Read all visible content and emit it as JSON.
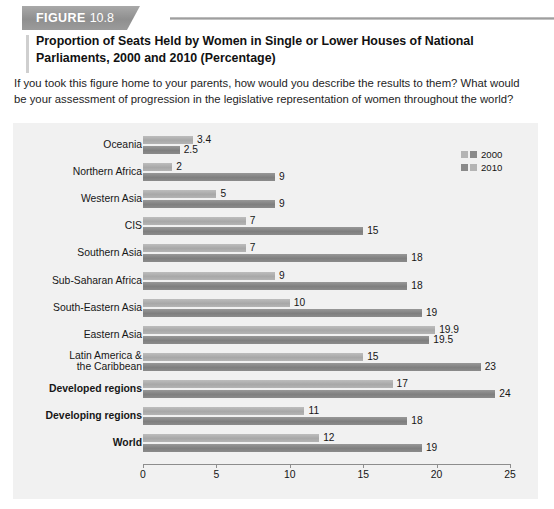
{
  "figure": {
    "badge_word": "FIGURE",
    "badge_number": "10.8",
    "title": "Proportion of Seats Held by Women in Single or Lower Houses of National Parliaments, 2000 and 2010 (Percentage)",
    "prompt": "If you took this figure home to your parents, how would you describe the results to them? What would be your assessment of progression in the legislative representation of women throughout the world?"
  },
  "chart_data": {
    "type": "bar",
    "orientation": "horizontal",
    "title": "Proportion of Seats Held by Women in Single or Lower Houses of National Parliaments, 2000 and 2010 (Percentage)",
    "xlabel": "",
    "ylabel": "",
    "xlim": [
      0,
      25
    ],
    "xticks": [
      "0",
      "5",
      "10",
      "15",
      "20",
      "25"
    ],
    "grid": false,
    "legend_position": "top-right",
    "legend": [
      "2000",
      "2010"
    ],
    "colors": {
      "series_2000": "#b4b4b4",
      "series_2010": "#8a8a8a",
      "panel": "#f1f1f1"
    },
    "categories": [
      "Oceania",
      "Northern Africa",
      "Western Asia",
      "CIS",
      "Southern Asia",
      "Sub-Saharan Africa",
      "South-Eastern Asia",
      "Eastern Asia",
      "Latin America & the Caribbean",
      "Developed regions",
      "Developing regions",
      "World"
    ],
    "series": [
      {
        "name": "2000",
        "values": [
          3.4,
          2,
          5,
          7,
          7,
          9,
          10,
          19.9,
          15,
          17,
          11,
          12
        ],
        "labels": [
          "3.4",
          "2",
          "5",
          "7",
          "7",
          "9",
          "10",
          "19.9",
          "15",
          "17",
          "11",
          "12"
        ]
      },
      {
        "name": "2010",
        "values": [
          2.5,
          9,
          9,
          15,
          18,
          18,
          19,
          19.5,
          23,
          24,
          18,
          19
        ],
        "labels": [
          "2.5",
          "9",
          "9",
          "15",
          "18",
          "18",
          "19",
          "19.5",
          "23",
          "24",
          "18",
          "19"
        ]
      }
    ],
    "rows": [
      {
        "label": "Oceania",
        "bold": false,
        "two_line": false,
        "top": {
          "series": "2000",
          "value": 3.4,
          "label": "3.4"
        },
        "bottom": {
          "series": "2010",
          "value": 2.5,
          "label": "2.5"
        }
      },
      {
        "label": "Northern Africa",
        "bold": false,
        "two_line": false,
        "top": {
          "series": "2000",
          "value": 2,
          "label": "2"
        },
        "bottom": {
          "series": "2010",
          "value": 9,
          "label": "9"
        }
      },
      {
        "label": "Western Asia",
        "bold": false,
        "two_line": false,
        "top": {
          "series": "2000",
          "value": 5,
          "label": "5"
        },
        "bottom": {
          "series": "2010",
          "value": 9,
          "label": "9"
        }
      },
      {
        "label": "CIS",
        "bold": false,
        "two_line": false,
        "top": {
          "series": "2000",
          "value": 7,
          "label": "7"
        },
        "bottom": {
          "series": "2010",
          "value": 15,
          "label": "15"
        }
      },
      {
        "label": "Southern Asia",
        "bold": false,
        "two_line": false,
        "top": {
          "series": "2000",
          "value": 7,
          "label": "7"
        },
        "bottom": {
          "series": "2010",
          "value": 18,
          "label": "18"
        }
      },
      {
        "label": "Sub-Saharan Africa",
        "bold": false,
        "two_line": false,
        "top": {
          "series": "2000",
          "value": 9,
          "label": "9"
        },
        "bottom": {
          "series": "2010",
          "value": 18,
          "label": "18"
        }
      },
      {
        "label": "South-Eastern Asia",
        "bold": false,
        "two_line": false,
        "top": {
          "series": "2000",
          "value": 10,
          "label": "10"
        },
        "bottom": {
          "series": "2010",
          "value": 19,
          "label": "19"
        }
      },
      {
        "label": "Eastern Asia",
        "bold": false,
        "two_line": false,
        "top": {
          "series": "2000",
          "value": 19.9,
          "label": "19.9"
        },
        "bottom": {
          "series": "2010",
          "value": 19.5,
          "label": "19.5"
        }
      },
      {
        "label": "Latin America &\nthe Caribbean",
        "bold": false,
        "two_line": true,
        "label_line1": "Latin America &",
        "label_line2": "the Caribbean",
        "top": {
          "series": "2000",
          "value": 15,
          "label": "15"
        },
        "bottom": {
          "series": "2010",
          "value": 23,
          "label": "23"
        }
      },
      {
        "label": "Developed regions",
        "bold": true,
        "two_line": false,
        "top": {
          "series": "2000",
          "value": 17,
          "label": "17"
        },
        "bottom": {
          "series": "2010",
          "value": 24,
          "label": "24"
        }
      },
      {
        "label": "Developing regions",
        "bold": true,
        "two_line": false,
        "top": {
          "series": "2000",
          "value": 11,
          "label": "11"
        },
        "bottom": {
          "series": "2010",
          "value": 18,
          "label": "18"
        }
      },
      {
        "label": "World",
        "bold": true,
        "two_line": false,
        "top": {
          "series": "2000",
          "value": 12,
          "label": "12"
        },
        "bottom": {
          "series": "2010",
          "value": 19,
          "label": "19"
        }
      }
    ]
  }
}
